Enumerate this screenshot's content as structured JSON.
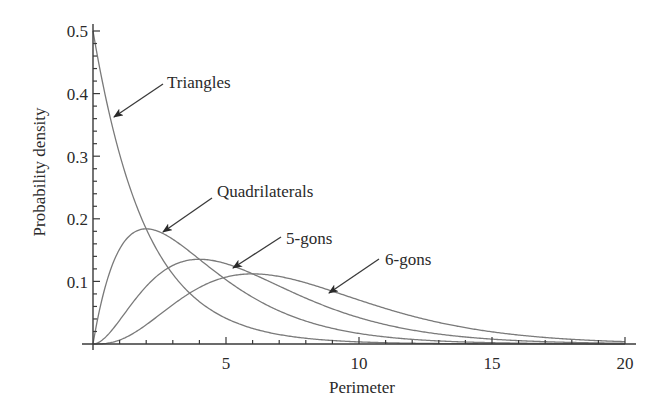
{
  "chart_data": {
    "type": "line",
    "title": "",
    "xlabel": "Perimeter",
    "ylabel": "Probability density",
    "xlim": [
      0,
      20
    ],
    "ylim": [
      0,
      0.5
    ],
    "grid": false,
    "legend_position": "inline arrow annotations",
    "x_ticks": [
      5,
      10,
      15,
      20
    ],
    "x_tick_labels": [
      "5",
      "10",
      "15",
      "20"
    ],
    "x_minor_step": 1,
    "y_ticks": [
      0.1,
      0.2,
      0.3,
      0.4,
      0.5
    ],
    "y_tick_labels": [
      "0.1",
      "0.2",
      "0.3",
      "0.4",
      "0.5"
    ],
    "y_minor_step": 0.02,
    "series": [
      {
        "name": "Triangles",
        "distribution": "gamma",
        "shape_k": 1,
        "scale_theta": 2,
        "mode": 0,
        "peak_density": 0.5,
        "x": [
          0,
          1,
          2,
          3,
          4,
          5,
          6,
          8,
          10,
          12,
          15,
          20
        ],
        "values": [
          0.5,
          0.303,
          0.184,
          0.112,
          0.068,
          0.041,
          0.025,
          0.009,
          0.003,
          0.001,
          0.0003,
          0.0
        ]
      },
      {
        "name": "Quadrilaterals",
        "distribution": "gamma",
        "shape_k": 2,
        "scale_theta": 2,
        "mode": 2,
        "peak_density": 0.184,
        "x": [
          0,
          1,
          2,
          3,
          4,
          5,
          6,
          8,
          10,
          12,
          15,
          20
        ],
        "values": [
          0.0,
          0.152,
          0.184,
          0.167,
          0.135,
          0.103,
          0.075,
          0.037,
          0.017,
          0.007,
          0.002,
          0.0
        ]
      },
      {
        "name": "5-gons",
        "distribution": "gamma",
        "shape_k": 3,
        "scale_theta": 2,
        "mode": 4,
        "peak_density": 0.135,
        "x": [
          0,
          1,
          2,
          3,
          4,
          5,
          6,
          8,
          10,
          12,
          15,
          20
        ],
        "values": [
          0.0,
          0.038,
          0.092,
          0.126,
          0.135,
          0.128,
          0.112,
          0.073,
          0.042,
          0.022,
          0.007,
          0.0
        ]
      },
      {
        "name": "6-gons",
        "distribution": "gamma",
        "shape_k": 4,
        "scale_theta": 2,
        "mode": 6,
        "peak_density": 0.112,
        "x": [
          0,
          1,
          2,
          3,
          4,
          5,
          6,
          8,
          10,
          12,
          15,
          20
        ],
        "values": [
          0.0,
          0.006,
          0.031,
          0.063,
          0.09,
          0.107,
          0.112,
          0.098,
          0.07,
          0.045,
          0.019,
          0.002
        ]
      }
    ],
    "annotations": [
      {
        "text": "Triangles",
        "points_to_series": "Triangles"
      },
      {
        "text": "Quadrilaterals",
        "points_to_series": "Quadrilaterals"
      },
      {
        "text": "5-gons",
        "points_to_series": "5-gons"
      },
      {
        "text": "6-gons",
        "points_to_series": "6-gons"
      }
    ]
  },
  "labels": {
    "xlabel": "Perimeter",
    "ylabel": "Probability density",
    "x_ticks": [
      "5",
      "10",
      "15",
      "20"
    ],
    "y_ticks": [
      "0.1",
      "0.2",
      "0.3",
      "0.4",
      "0.5"
    ],
    "triangles": "Triangles",
    "quadrilaterals": "Quadrilaterals",
    "pentagons": "5-gons",
    "hexagons": "6-gons"
  },
  "colors": {
    "curve": "#7a7a7a",
    "axis": "#3a3a3a",
    "text": "#2a2a2a",
    "background": "#ffffff"
  }
}
